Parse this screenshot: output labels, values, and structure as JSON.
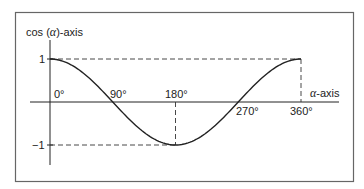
{
  "chart_data": {
    "type": "line",
    "title": "",
    "function": "cos(alpha)",
    "xlabel": "α-axis",
    "ylabel": "cos (α)-axis",
    "x_unit": "degrees",
    "xlim": [
      0,
      360
    ],
    "ylim": [
      -1,
      1
    ],
    "x_ticks": [
      {
        "value": 0,
        "label": "0°"
      },
      {
        "value": 90,
        "label": "90°"
      },
      {
        "value": 180,
        "label": "180°"
      },
      {
        "value": 270,
        "label": "270°"
      },
      {
        "value": 360,
        "label": "360°"
      }
    ],
    "y_ticks": [
      {
        "value": 1,
        "label": "1"
      },
      {
        "value": -1,
        "label": "−1"
      }
    ],
    "x": [
      0,
      45,
      90,
      135,
      180,
      225,
      270,
      315,
      360
    ],
    "series": [
      {
        "name": "cos(α)",
        "values": [
          1,
          0.707,
          0,
          -0.707,
          -1,
          -0.707,
          0,
          0.707,
          1
        ]
      }
    ],
    "reference_lines": [
      {
        "type": "horizontal-dashed",
        "y": 1,
        "from_x": 0,
        "to_x": 360
      },
      {
        "type": "vertical-dashed",
        "x": 360,
        "from_y": 1,
        "to_y": 0
      },
      {
        "type": "horizontal-dashed",
        "y": -1,
        "from_x": 0,
        "to_x": 180
      },
      {
        "type": "vertical-dashed",
        "x": 180,
        "from_y": 0,
        "to_y": -1
      }
    ],
    "grid": false,
    "legend": false,
    "frame": true
  },
  "labels": {
    "y_axis_prefix": "cos (",
    "y_axis_alpha": "α",
    "y_axis_suffix": ")-axis",
    "x_axis_alpha": "α",
    "x_axis_suffix": "-axis",
    "tick_0": "0°",
    "tick_90": "90°",
    "tick_180": "180°",
    "tick_270": "270°",
    "tick_360": "360°",
    "y_one": "1",
    "y_minus_one": "−1"
  },
  "colors": {
    "stroke": "#222222",
    "frame": "#555555",
    "background": "#ffffff"
  }
}
